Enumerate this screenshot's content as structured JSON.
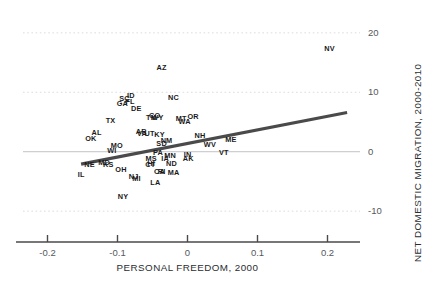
{
  "chart_data": {
    "type": "scatter",
    "title": "",
    "xlabel": "PERSONAL FREEDOM, 2000",
    "ylabel": "NET DOMESTIC MIGRATION, 2000-2010",
    "xlim": [
      -0.235,
      0.235
    ],
    "ylim": [
      -12.5,
      22.5
    ],
    "xticks": [
      "-0.2",
      "-0.1",
      "0",
      "0.1",
      "0.2"
    ],
    "xtick_values": [
      -0.2,
      -0.1,
      0,
      0.1,
      0.2
    ],
    "yticks": [
      "20",
      "10",
      "0",
      "-10"
    ],
    "ytick_values": [
      20,
      10,
      0,
      -10
    ],
    "grid": "horizontal-dotted",
    "legend": "none",
    "marker_style": "text-label-only",
    "colors": {
      "trendline": "#4a4a4a",
      "gridline": "#d8d8d8",
      "axis": "#4a4a4a",
      "label_text": "#1a1a1a",
      "tick_text": "#55585c",
      "background": "#ffffff"
    },
    "trendline": {
      "type": "linear",
      "x_start": -0.152,
      "y_start": -2.1,
      "x_end": 0.228,
      "y_end": 6.6
    },
    "points": [
      {
        "label": "NV",
        "x": 0.203,
        "y": 17.3
      },
      {
        "label": "AZ",
        "x": -0.037,
        "y": 14.1
      },
      {
        "label": "ID",
        "x": -0.081,
        "y": 9.3
      },
      {
        "label": "SC",
        "x": -0.09,
        "y": 8.9
      },
      {
        "label": "NC",
        "x": -0.02,
        "y": 9.0
      },
      {
        "label": "FL",
        "x": -0.082,
        "y": 8.3
      },
      {
        "label": "GA",
        "x": -0.093,
        "y": 8.0
      },
      {
        "label": "DE",
        "x": -0.073,
        "y": 7.2
      },
      {
        "label": "CO",
        "x": -0.047,
        "y": 6.0
      },
      {
        "label": "WY",
        "x": -0.043,
        "y": 5.6
      },
      {
        "label": "TN",
        "x": -0.052,
        "y": 5.7
      },
      {
        "label": "OR",
        "x": 0.008,
        "y": 5.9
      },
      {
        "label": "MT",
        "x": -0.009,
        "y": 5.5
      },
      {
        "label": "WA",
        "x": -0.004,
        "y": 5.0
      },
      {
        "label": "TX",
        "x": -0.11,
        "y": 5.2
      },
      {
        "label": "AR",
        "x": -0.066,
        "y": 3.4
      },
      {
        "label": "VA",
        "x": -0.065,
        "y": 2.9
      },
      {
        "label": "UT",
        "x": -0.054,
        "y": 3.0
      },
      {
        "label": "KY",
        "x": -0.04,
        "y": 2.8
      },
      {
        "label": "AL",
        "x": -0.13,
        "y": 3.1
      },
      {
        "label": "NH",
        "x": 0.018,
        "y": 2.6
      },
      {
        "label": "OK",
        "x": -0.138,
        "y": 2.2
      },
      {
        "label": "NM",
        "x": -0.03,
        "y": 1.8
      },
      {
        "label": "ME",
        "x": 0.062,
        "y": 2.0
      },
      {
        "label": "WV",
        "x": 0.032,
        "y": 1.2
      },
      {
        "label": "SD",
        "x": -0.037,
        "y": 1.3
      },
      {
        "label": "MO",
        "x": -0.101,
        "y": 0.9
      },
      {
        "label": "WI",
        "x": -0.108,
        "y": 0.2
      },
      {
        "label": "VT",
        "x": 0.052,
        "y": -0.3
      },
      {
        "label": "PA",
        "x": -0.042,
        "y": -0.3
      },
      {
        "label": "MN",
        "x": -0.025,
        "y": -0.8
      },
      {
        "label": "IN",
        "x": 0.0,
        "y": -0.6
      },
      {
        "label": "IA",
        "x": -0.032,
        "y": -1.3
      },
      {
        "label": "AK",
        "x": 0.001,
        "y": -1.3
      },
      {
        "label": "MS",
        "x": -0.052,
        "y": -1.2
      },
      {
        "label": "MD",
        "x": -0.119,
        "y": -1.9
      },
      {
        "label": "NE",
        "x": -0.14,
        "y": -2.3
      },
      {
        "label": "KS",
        "x": -0.113,
        "y": -2.3
      },
      {
        "label": "CT",
        "x": -0.053,
        "y": -2.2
      },
      {
        "label": "HI",
        "x": -0.052,
        "y": -2.0
      },
      {
        "label": "ND",
        "x": -0.023,
        "y": -2.1
      },
      {
        "label": "OH",
        "x": -0.095,
        "y": -3.0
      },
      {
        "label": "MA",
        "x": -0.02,
        "y": -3.5
      },
      {
        "label": "CA",
        "x": -0.04,
        "y": -3.4
      },
      {
        "label": "RI",
        "x": -0.037,
        "y": -3.4
      },
      {
        "label": "IL",
        "x": -0.152,
        "y": -4.0
      },
      {
        "label": "NJ",
        "x": -0.077,
        "y": -4.3
      },
      {
        "label": "MI",
        "x": -0.073,
        "y": -4.6
      },
      {
        "label": "LA",
        "x": -0.046,
        "y": -5.3
      },
      {
        "label": "NY",
        "x": -0.092,
        "y": -7.6
      }
    ]
  }
}
